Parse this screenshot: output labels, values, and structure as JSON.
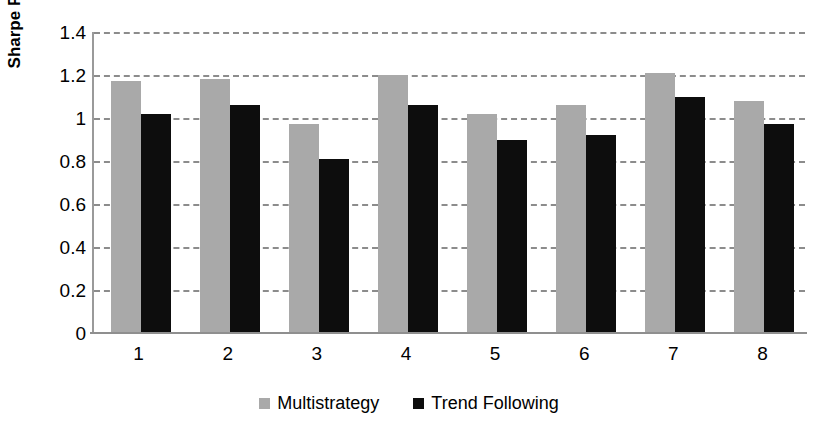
{
  "chart_data": {
    "type": "bar",
    "title": "",
    "subtitle": "",
    "xlabel": "",
    "ylabel": "Sharpe Ratio",
    "categories": [
      "1",
      "2",
      "3",
      "4",
      "5",
      "6",
      "7",
      "8"
    ],
    "series": [
      {
        "name": "Multistrategy",
        "color": "#a9a9a9",
        "values": [
          1.17,
          1.18,
          0.97,
          1.2,
          1.02,
          1.06,
          1.21,
          1.08
        ]
      },
      {
        "name": "Trend Following",
        "color": "#0d0d0d",
        "values": [
          1.02,
          1.06,
          0.81,
          1.06,
          0.9,
          0.92,
          1.1,
          0.97
        ]
      }
    ],
    "ylim": [
      0,
      1.4
    ],
    "y_ticks": [
      0,
      0.2,
      0.4,
      0.6,
      0.8,
      1,
      1.2,
      1.4
    ],
    "y_tick_labels": [
      "0",
      "0.2",
      "0.4",
      "0.6",
      "0.8",
      "1",
      "1.2",
      "1.4"
    ],
    "grid": true,
    "grid_axis": "y",
    "grid_style": "dashed",
    "grid_color": "#8c8c8c",
    "legend_position": "bottom-center",
    "axis_color": "#9a9a9a",
    "background": "#ffffff"
  },
  "legend": {
    "entries": [
      {
        "label": "Multistrategy",
        "swatch": "gray-square-swatch"
      },
      {
        "label": "Trend Following",
        "swatch": "black-square-swatch"
      }
    ]
  },
  "axes": {
    "y_title": "Sharpe Ratio"
  }
}
